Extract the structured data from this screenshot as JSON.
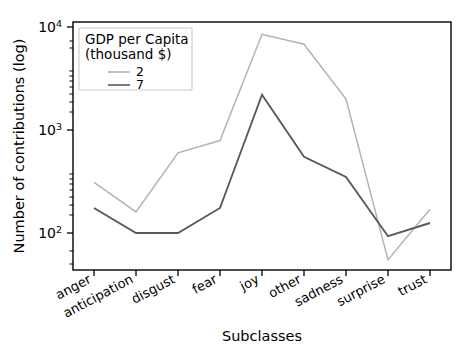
{
  "chart_data": {
    "type": "line",
    "title": "",
    "xlabel": "Subclasses",
    "ylabel": "Number of contributions (log)",
    "yscale": "log",
    "ylim": [
      40,
      11000
    ],
    "ytick_labels": [
      "10²",
      "10³",
      "10⁴"
    ],
    "ytick_values": [
      100,
      1000,
      10000
    ],
    "ytick_mantissa": [
      "10",
      "10",
      "10"
    ],
    "ytick_exponents": [
      "2",
      "3",
      "4"
    ],
    "grid": false,
    "legend_position": "upper-left-inside",
    "categories": [
      "anger",
      "anticipation",
      "disgust",
      "fear",
      "joy",
      "other",
      "sadness",
      "surprise",
      "trust"
    ],
    "series": [
      {
        "name": "2",
        "color": "#b3b3b3",
        "values": [
          310,
          160,
          600,
          790,
          8500,
          6800,
          2000,
          55,
          170
        ]
      },
      {
        "name": "7",
        "color": "#595959",
        "values": [
          175,
          100,
          100,
          175,
          2200,
          550,
          350,
          93,
          125
        ]
      }
    ]
  },
  "legend": {
    "title_line1": "GDP per Capita",
    "title_line2": "(thousand $)",
    "entries": [
      {
        "label": "2",
        "color": "#b3b3b3"
      },
      {
        "label": "7",
        "color": "#595959"
      }
    ]
  },
  "axes": {
    "xlabel": "Subclasses",
    "ylabel": "Number of contributions (log)"
  }
}
